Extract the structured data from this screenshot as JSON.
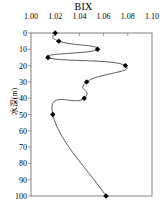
{
  "chart_data": {
    "type": "line",
    "title": "BIX",
    "xlabel": "BIX",
    "ylabel": "水深(m)",
    "xlim": [
      1.0,
      1.1
    ],
    "ylim": [
      0,
      100
    ],
    "y_inverted": true,
    "grid": false,
    "legend": null,
    "marker": "filled-diamond",
    "x_ticks": [
      1.0,
      1.02,
      1.04,
      1.06,
      1.08,
      1.1
    ],
    "x_tick_labels": [
      "1.00",
      "1.02",
      "1.04",
      "1.06",
      "1.08",
      "1.10"
    ],
    "y_ticks": [
      0,
      10,
      20,
      30,
      40,
      50,
      60,
      70,
      80,
      90,
      100
    ],
    "y_tick_labels": [
      "0",
      "10",
      "20",
      "30",
      "40",
      "50",
      "60",
      "70",
      "80",
      "90",
      "100"
    ],
    "series": [
      {
        "name": "BIX",
        "x": [
          1.02,
          1.023,
          1.055,
          1.014,
          1.078,
          1.046,
          1.044,
          1.018,
          1.062
        ],
        "y": [
          0,
          5,
          10,
          15,
          20,
          30,
          40,
          50,
          100
        ]
      }
    ],
    "line_color": "#333333",
    "marker_color": "#000000",
    "axis_color": "#808080"
  }
}
